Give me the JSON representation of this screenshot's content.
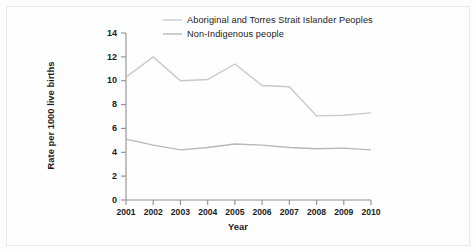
{
  "chart_data": {
    "type": "line",
    "title": "",
    "subtitle": "",
    "xlabel": "Year",
    "ylabel": "Rate per 1000 live births",
    "categories": [
      "2001",
      "2002",
      "2003",
      "2004",
      "2005",
      "2006",
      "2007",
      "2008",
      "2009",
      "2010"
    ],
    "x": [
      2001,
      2002,
      2003,
      2004,
      2005,
      2006,
      2007,
      2008,
      2009,
      2010
    ],
    "xlim": [
      2001,
      2010
    ],
    "ylim": [
      0,
      14
    ],
    "yticks": [
      0,
      2,
      4,
      6,
      8,
      10,
      12,
      14
    ],
    "ytick_labels": [
      "0",
      "2",
      "4",
      "6",
      "8",
      "10",
      "12",
      "14"
    ],
    "grid": false,
    "legend_position": "top-center",
    "series": [
      {
        "name": "Aboriginal and Torres Strait Islander Peoples",
        "color": "#c9c9c9",
        "values": [
          10.3,
          12.0,
          10.0,
          10.1,
          11.4,
          9.6,
          9.5,
          7.05,
          7.1,
          7.3
        ]
      },
      {
        "name": "Non-Indigenous people",
        "color": "#b8b8b8",
        "values": [
          5.1,
          4.6,
          4.2,
          4.4,
          4.7,
          4.6,
          4.4,
          4.3,
          4.35,
          4.2
        ]
      }
    ]
  },
  "axis": {
    "y_ticks": [
      "0",
      "2",
      "4",
      "6",
      "8",
      "10",
      "12",
      "14"
    ],
    "x_ticks": [
      "2001",
      "2002",
      "2003",
      "2004",
      "2005",
      "2006",
      "2007",
      "2008",
      "2009",
      "2010"
    ],
    "y_title": "Rate per 1000 live births",
    "x_title": "Year"
  },
  "legend": {
    "items": [
      {
        "label": "Aboriginal and Torres Strait Islander Peoples"
      },
      {
        "label": "Non-Indigenous people"
      }
    ]
  },
  "colors": {
    "series_1": "#c9c9c9",
    "series_2": "#b8b8b8",
    "axis": "#8e8e8e",
    "text": "#1c1c1c",
    "background": "#fefefe"
  }
}
